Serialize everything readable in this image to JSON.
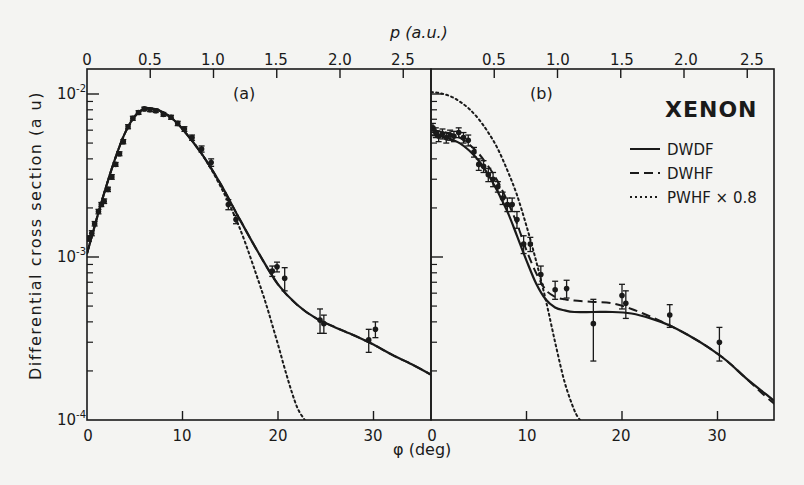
{
  "chart_data": {
    "type": "line",
    "title": "XENON",
    "xlabel": "φ (deg)",
    "x2label": "p (a.u.)",
    "ylabel": "Differential cross section (a u)",
    "yscale": "log",
    "ylim": [
      0.0001,
      0.01
    ],
    "y_tick_labels": [
      "10^-4",
      "10^-3",
      "10^-2"
    ],
    "x_tick_labels": [
      "0",
      "10",
      "20",
      "30"
    ],
    "x2_tick_labels": [
      "0",
      "0.5",
      "1.0",
      "1.5",
      "2.0",
      "2.5"
    ],
    "xlim": [
      0,
      36
    ],
    "legend": [
      {
        "label": "DWDF",
        "style": "solid"
      },
      {
        "label": "DWHF",
        "style": "dashed"
      },
      {
        "label": "PWHF × 0.8",
        "style": "dotted"
      }
    ],
    "panels": [
      {
        "label": "(a)",
        "series": [
          {
            "name": "DWDF",
            "style": "solid",
            "x": [
              0,
              1,
              2,
              3,
              4,
              5,
              6,
              7,
              8,
              9,
              10,
              12,
              14,
              16,
              18,
              20,
              22,
              24,
              26,
              28,
              30,
              32,
              34,
              36
            ],
            "y": [
              0.00105,
              0.0017,
              0.0027,
              0.0041,
              0.0058,
              0.0073,
              0.0081,
              0.0081,
              0.0077,
              0.007,
              0.0061,
              0.0043,
              0.0028,
              0.0017,
              0.00105,
              0.00068,
              0.00051,
              0.00042,
              0.00037,
              0.00033,
              0.00029,
              0.00025,
              0.00022,
              0.00019
            ]
          },
          {
            "name": "DWHF",
            "style": "dashed",
            "x": [
              0,
              1,
              2,
              3,
              4,
              5,
              6,
              7,
              8,
              9,
              10,
              12,
              14,
              16,
              18,
              20,
              22,
              24,
              26,
              28,
              30,
              32,
              34,
              36
            ],
            "y": [
              0.00105,
              0.0017,
              0.0027,
              0.0041,
              0.0058,
              0.0073,
              0.0081,
              0.0081,
              0.0077,
              0.007,
              0.0061,
              0.0043,
              0.0028,
              0.0017,
              0.00105,
              0.00068,
              0.00051,
              0.00042,
              0.00037,
              0.00033,
              0.00029,
              0.00025,
              0.00022,
              0.00019
            ]
          },
          {
            "name": "PWHF × 0.8",
            "style": "dotted",
            "x": [
              0,
              1,
              2,
              3,
              4,
              5,
              6,
              7,
              8,
              9,
              10,
              12,
              14,
              16,
              18,
              19,
              20,
              21,
              22,
              22.8
            ],
            "y": [
              0.00105,
              0.0017,
              0.0027,
              0.0041,
              0.0058,
              0.0073,
              0.0081,
              0.0081,
              0.0077,
              0.007,
              0.0061,
              0.0043,
              0.0027,
              0.0015,
              0.0007,
              0.00046,
              0.00029,
              0.00018,
              0.00012,
              0.0001
            ]
          },
          {
            "name": "experiment",
            "style": "points",
            "x": [
              0.2,
              0.5,
              0.8,
              1.2,
              1.5,
              1.8,
              2.2,
              2.6,
              3.0,
              3.4,
              3.8,
              4.3,
              4.8,
              5.4,
              6.0,
              6.6,
              7.2,
              8.0,
              8.8,
              9.5,
              10.2,
              11.0,
              12.0,
              13.0,
              14.8,
              15.6,
              19.4,
              19.9,
              20.7,
              24.4,
              24.8,
              29.5,
              30.2
            ],
            "y": [
              0.0013,
              0.0014,
              0.0016,
              0.0019,
              0.0021,
              0.0022,
              0.0026,
              0.0031,
              0.0037,
              0.0043,
              0.0051,
              0.0063,
              0.0071,
              0.0077,
              0.0081,
              0.008,
              0.0079,
              0.0075,
              0.0072,
              0.0066,
              0.0061,
              0.0054,
              0.0046,
              0.0038,
              0.0021,
              0.0017,
              0.00082,
              0.00087,
              0.00074,
              0.00041,
              0.00039,
              0.00031,
              0.00036
            ],
            "yerr": [
              5e-05,
              5e-05,
              5e-05,
              6e-05,
              6e-05,
              7e-05,
              8e-05,
              0.0001,
              0.0001,
              0.00012,
              0.00015,
              0.00018,
              0.0002,
              0.0002,
              0.0002,
              0.0002,
              0.0002,
              0.0002,
              0.0002,
              0.0002,
              0.0002,
              0.0002,
              0.0002,
              0.0002,
              0.00015,
              0.0001,
              6e-05,
              6e-05,
              0.00012,
              7e-05,
              5e-05,
              5e-05,
              4e-05
            ]
          }
        ]
      },
      {
        "label": "(b)",
        "series": [
          {
            "name": "DWDF",
            "style": "solid",
            "x": [
              0,
              1,
              2,
              3,
              4,
              5,
              6,
              7,
              8,
              9,
              10,
              11,
              12,
              13,
              14,
              15,
              17,
              19,
              21,
              23,
              25,
              27,
              29,
              31,
              33,
              35,
              36
            ],
            "y": [
              0.0056,
              0.0055,
              0.0053,
              0.005,
              0.0045,
              0.0039,
              0.0032,
              0.0025,
              0.0019,
              0.00135,
              0.00095,
              0.00069,
              0.00055,
              0.00049,
              0.00047,
              0.00046,
              0.00046,
              0.00046,
              0.00045,
              0.00042,
              0.00038,
              0.00033,
              0.00028,
              0.00023,
              0.00018,
              0.000145,
              0.00013
            ]
          },
          {
            "name": "DWHF",
            "style": "dashed",
            "x": [
              0,
              1,
              2,
              3,
              4,
              5,
              6,
              7,
              8,
              9,
              10,
              11,
              12,
              13,
              14,
              15,
              17,
              19,
              21,
              23,
              25,
              27,
              29,
              31,
              33,
              35,
              36
            ],
            "y": [
              0.006,
              0.0059,
              0.0057,
              0.0054,
              0.0049,
              0.0043,
              0.0036,
              0.0029,
              0.0022,
              0.0016,
              0.0011,
              0.0008,
              0.00063,
              0.00057,
              0.00055,
              0.00054,
              0.00053,
              0.00052,
              0.00048,
              0.00043,
              0.00038,
              0.00033,
              0.00028,
              0.00023,
              0.00018,
              0.00014,
              0.000125
            ]
          },
          {
            "name": "PWHF × 0.8",
            "style": "dotted",
            "x": [
              0,
              1,
              2,
              3,
              4,
              5,
              6,
              7,
              8,
              9,
              10,
              11,
              12,
              13,
              14,
              15,
              15.6
            ],
            "y": [
              0.0103,
              0.0101,
              0.0097,
              0.009,
              0.0081,
              0.007,
              0.0058,
              0.0046,
              0.0034,
              0.0024,
              0.00155,
              0.00095,
              0.00055,
              0.0003,
              0.00017,
              0.000115,
              0.0001
            ]
          },
          {
            "name": "experiment",
            "style": "points",
            "x": [
              0.2,
              0.5,
              0.8,
              1.2,
              1.6,
              2.0,
              2.4,
              2.9,
              3.4,
              3.9,
              4.5,
              5.0,
              5.5,
              6.0,
              6.5,
              7.0,
              7.5,
              8.0,
              8.5,
              9.0,
              9.7,
              10.4,
              11.5,
              13.0,
              14.2,
              17.0,
              20.0,
              20.4,
              25.0,
              30.2
            ],
            "y": [
              0.0062,
              0.0058,
              0.0055,
              0.0057,
              0.0054,
              0.0056,
              0.0055,
              0.0058,
              0.0054,
              0.0052,
              0.0044,
              0.0037,
              0.0036,
              0.0032,
              0.003,
              0.0027,
              0.0023,
              0.0021,
              0.0021,
              0.0017,
              0.0012,
              0.0012,
              0.00078,
              0.00063,
              0.00064,
              0.00039,
              0.00058,
              0.00052,
              0.00044,
              0.0003
            ],
            "yerr": [
              0.0004,
              0.0004,
              0.0004,
              0.0004,
              0.0004,
              0.0004,
              0.0004,
              0.0004,
              0.0004,
              0.0004,
              0.0003,
              0.0003,
              0.0003,
              0.0003,
              0.0003,
              0.0002,
              0.0002,
              0.0002,
              0.0002,
              0.0002,
              0.00015,
              0.00012,
              0.0001,
              8e-05,
              8e-05,
              0.00016,
              0.0001,
              0.0001,
              7e-05,
              7e-05
            ]
          }
        ]
      }
    ]
  },
  "labels": {
    "top_axis_title": "p (a.u.)",
    "bottom_axis_title": "φ (deg)",
    "y_axis_title": "Differential cross section (a u)",
    "panel_a": "(a)",
    "panel_b": "(b)",
    "element": "XENON",
    "legend": [
      "DWDF",
      "DWHF",
      "PWHF × 0.8"
    ],
    "y_ticks": [
      {
        "base": "10",
        "exp": "-2"
      },
      {
        "base": "10",
        "exp": "-3"
      },
      {
        "base": "10",
        "exp": "-4"
      }
    ],
    "x_ticks_a": [
      "0",
      "10",
      "20",
      "30"
    ],
    "x_ticks_b": [
      "0",
      "10",
      "20",
      "30"
    ],
    "p_ticks_a": [
      "0",
      "0.5",
      "1.0",
      "1.5",
      "2.0",
      "2.5"
    ],
    "p_ticks_b": [
      "0.5",
      "1.0",
      "1.5",
      "2.0",
      "2.5"
    ]
  }
}
